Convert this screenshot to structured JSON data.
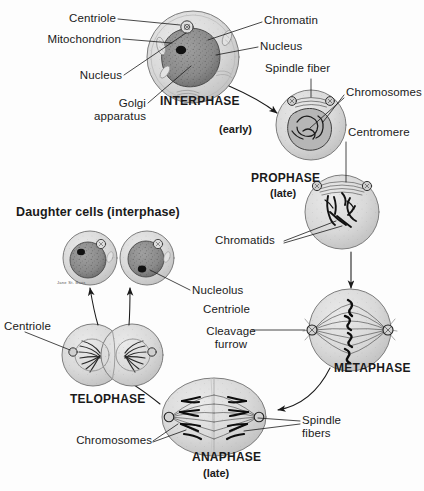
{
  "diagram": {
    "type": "biology-illustration",
    "background_color": "#fdfdfd",
    "ink_color": "#1a1a1a",
    "cell_fill": "#d8d8d8",
    "nucleus_fill": "#8e8e8e"
  },
  "labels": {
    "centriole_top": "Centriole",
    "chromatin": "Chromatin",
    "mitochondrion": "Mitochondrion",
    "nucleus_right": "Nucleus",
    "nucleus_left": "Nucleus",
    "golgi_line1": "Golgi",
    "golgi_line2": "apparatus",
    "spindle_fiber": "Spindle fiber",
    "chromosomes_top": "Chromosomes",
    "centromere": "Centromere",
    "chromatids": "Chromatids",
    "centriole_metaphase": "Centriole",
    "cleavage_line1": "Cleavage",
    "cleavage_line2": "furrow",
    "spindle_fibers_line1": "Spindle",
    "spindle_fibers_line2": "fibers",
    "chromosomes_bottom": "Chromosomes",
    "nucleolus": "Nucleolus",
    "centriole_telophase": "Centriole",
    "daughter_cells": "Daughter cells (interphase)",
    "artist_signature": "Jane St. Bass"
  },
  "phases": [
    {
      "id": "interphase",
      "name": "INTERPHASE",
      "qualifier": ""
    },
    {
      "id": "prophase-early",
      "name": "",
      "qualifier": "(early)"
    },
    {
      "id": "prophase-late",
      "name": "PROPHASE",
      "qualifier": "(late)"
    },
    {
      "id": "metaphase",
      "name": "METAPHASE",
      "qualifier": ""
    },
    {
      "id": "anaphase",
      "name": "ANAPHASE",
      "qualifier": "(late)"
    },
    {
      "id": "telophase",
      "name": "TELOPHASE",
      "qualifier": ""
    }
  ],
  "phase_labels": {
    "interphase": "INTERPHASE",
    "prophase_early": "(early)",
    "prophase": "PROPHASE",
    "prophase_late": "(late)",
    "metaphase": "METAPHASE",
    "anaphase": "ANAPHASE",
    "anaphase_late": "(late)",
    "telophase": "TELOPHASE"
  }
}
